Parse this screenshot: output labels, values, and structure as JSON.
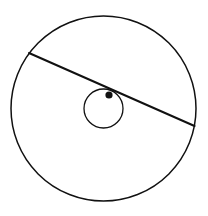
{
  "diagram": {
    "width": 208,
    "height": 216,
    "background": "#ffffff",
    "stroke_color": "#111111",
    "outer_circle": {
      "cx": 103.5,
      "cy": 108.5,
      "r": 92.5,
      "stroke_width": 1.5
    },
    "inner_circle": {
      "cx": 103.5,
      "cy": 108.5,
      "r": 19.5,
      "stroke_width": 1.3
    },
    "chord": {
      "x1": 29,
      "y1": 53,
      "x2": 194.5,
      "y2": 126,
      "stroke_width": 2
    },
    "point": {
      "cx": 109,
      "cy": 95,
      "r": 3.6
    }
  }
}
